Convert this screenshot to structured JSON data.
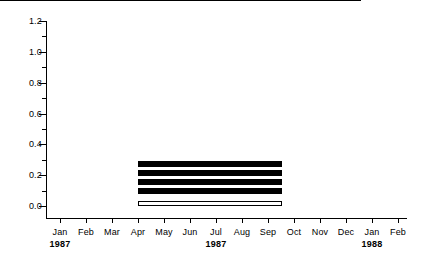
{
  "chart_data": {
    "type": "bar",
    "orientation": "horizontal",
    "title": "",
    "subtitle": "",
    "xlabel": "",
    "ylabel": "",
    "grid": false,
    "legend": null,
    "ylim": [
      0.0,
      1.2
    ],
    "y_ticks": [
      "0.0",
      "0.2",
      "0.4",
      "0.6",
      "0.8",
      "1.0",
      "1.2"
    ],
    "y_tick_values": [
      0.0,
      0.2,
      0.4,
      0.6,
      0.8,
      1.0,
      1.2
    ],
    "y_minor_tick_values": [
      0.1,
      0.3,
      0.5,
      0.7,
      0.9,
      1.1
    ],
    "x_categories": [
      "Jan",
      "Feb",
      "Mar",
      "Apr",
      "May",
      "Jun",
      "Jul",
      "Aug",
      "Sep",
      "Oct",
      "Nov",
      "Dec",
      "Jan",
      "Feb"
    ],
    "x_year_labels": [
      {
        "index": 0,
        "label": "1987"
      },
      {
        "index": 6,
        "label": "1987"
      },
      {
        "index": 12,
        "label": "1988"
      }
    ],
    "bars": [
      {
        "name": "bar-1",
        "start_index": 3,
        "end_index": 8.55,
        "y_low": 0.255,
        "y_high": 0.295,
        "fill": "solid",
        "color": "#000000"
      },
      {
        "name": "bar-2",
        "start_index": 3,
        "end_index": 8.55,
        "y_low": 0.195,
        "y_high": 0.235,
        "fill": "solid",
        "color": "#000000"
      },
      {
        "name": "bar-3",
        "start_index": 3,
        "end_index": 8.55,
        "y_low": 0.135,
        "y_high": 0.175,
        "fill": "solid",
        "color": "#000000"
      },
      {
        "name": "bar-4",
        "start_index": 3,
        "end_index": 8.55,
        "y_low": 0.075,
        "y_high": 0.115,
        "fill": "solid",
        "color": "#000000"
      },
      {
        "name": "bar-5",
        "start_index": 3,
        "end_index": 8.55,
        "y_low": 0.0,
        "y_high": 0.032,
        "fill": "hollow",
        "color": "#ffffff"
      }
    ],
    "series": [
      {
        "name": "bar-1",
        "values": [
          0.295
        ]
      },
      {
        "name": "bar-2",
        "values": [
          0.235
        ]
      },
      {
        "name": "bar-3",
        "values": [
          0.175
        ]
      },
      {
        "name": "bar-4",
        "values": [
          0.115
        ]
      },
      {
        "name": "bar-5",
        "values": [
          0.032
        ]
      }
    ],
    "colors": {
      "axis": "#000000",
      "bar_fill": "#000000",
      "bar_hollow_fill": "#ffffff",
      "background": "#ffffff"
    }
  }
}
